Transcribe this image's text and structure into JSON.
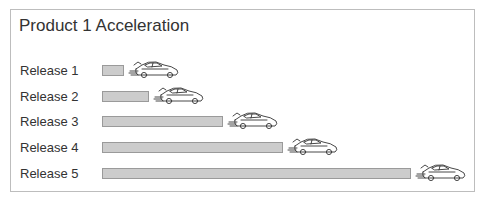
{
  "chart_data": {
    "type": "bar",
    "orientation": "horizontal",
    "title": "Product 1 Acceleration",
    "categories": [
      "Release 1",
      "Release 2",
      "Release 3",
      "Release 4",
      "Release 5"
    ],
    "values": [
      22,
      47,
      121,
      181,
      309
    ],
    "value_units": "relative bar length (px)",
    "xlabel": "",
    "ylabel": "",
    "grid": false,
    "legend": "none",
    "annotations": [
      "car icon at end of each bar"
    ],
    "colors": {
      "bar_fill": "#cccccc",
      "bar_border": "#9a9a9a",
      "frame": "#bdbdbd",
      "text": "#333333"
    }
  }
}
